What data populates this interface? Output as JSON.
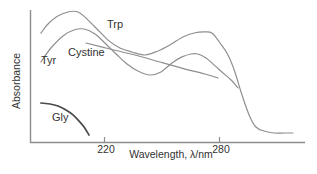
{
  "figure": {
    "background": "#ffffff",
    "text_color": "#333333",
    "axis_color": "#8d8d8d"
  },
  "chart_data": {
    "type": "line",
    "title": "",
    "xlabel": "Wavelength, λ/nm",
    "ylabel": "Absorbance",
    "x_unit": "nm",
    "y_unit": "relative absorbance (unlabeled axis)",
    "x_range_nm": [
      181,
      320
    ],
    "y_range_rel": [
      0,
      1.05
    ],
    "grid": false,
    "legend": "inline-labels",
    "x_ticks": [
      {
        "label": "220",
        "nm": 220
      },
      {
        "label": "280",
        "nm": 280
      }
    ],
    "series": [
      {
        "name": "Trp",
        "color": "#8f8f8f",
        "width": 1.2,
        "label_anchor_px": {
          "x": 107,
          "y": 28
        },
        "points": [
          [
            187.1,
            0.827
          ],
          [
            191.8,
            0.91
          ],
          [
            198.1,
            0.97
          ],
          [
            206.4,
            0.985
          ],
          [
            215.3,
            0.872
          ],
          [
            222.1,
            0.774
          ],
          [
            228.3,
            0.714
          ],
          [
            234.6,
            0.684
          ],
          [
            241.4,
            0.662
          ],
          [
            248.2,
            0.692
          ],
          [
            254.4,
            0.737
          ],
          [
            261.2,
            0.797
          ],
          [
            267.0,
            0.827
          ],
          [
            272.2,
            0.835
          ],
          [
            276.3,
            0.827
          ],
          [
            280.5,
            0.752
          ],
          [
            284.7,
            0.662
          ],
          [
            288.3,
            0.534
          ],
          [
            292.0,
            0.361
          ],
          [
            295.7,
            0.211
          ],
          [
            299.3,
            0.12
          ],
          [
            303.5,
            0.09
          ],
          [
            308.7,
            0.075
          ],
          [
            314.4,
            0.075
          ],
          [
            318.6,
            0.075
          ]
        ]
      },
      {
        "name": "Tyr",
        "color": "#8f8f8f",
        "width": 1.2,
        "label_anchor_px": {
          "x": 41,
          "y": 64
        },
        "points": [
          [
            187.1,
            0.609
          ],
          [
            192.3,
            0.714
          ],
          [
            198.6,
            0.805
          ],
          [
            204.3,
            0.85
          ],
          [
            209.6,
            0.857
          ],
          [
            215.3,
            0.82
          ],
          [
            221.0,
            0.744
          ],
          [
            226.3,
            0.669
          ],
          [
            232.0,
            0.594
          ],
          [
            237.7,
            0.541
          ],
          [
            244.0,
            0.511
          ],
          [
            249.7,
            0.534
          ],
          [
            255.5,
            0.602
          ],
          [
            260.7,
            0.647
          ],
          [
            265.4,
            0.669
          ],
          [
            269.0,
            0.669
          ],
          [
            273.2,
            0.639
          ],
          [
            277.4,
            0.587
          ],
          [
            282.1,
            0.526
          ],
          [
            286.3,
            0.474
          ],
          [
            289.9,
            0.414
          ]
        ]
      },
      {
        "name": "Cystine",
        "color": "#8f8f8f",
        "width": 1.2,
        "label_anchor_px": {
          "x": 68,
          "y": 56
        },
        "points": [
          [
            210.6,
            0.752
          ],
          [
            223.1,
            0.707
          ],
          [
            236.2,
            0.662
          ],
          [
            249.2,
            0.609
          ],
          [
            262.3,
            0.556
          ],
          [
            272.7,
            0.519
          ],
          [
            279.5,
            0.489
          ]
        ]
      },
      {
        "name": "Gly",
        "color": "#4a4a4a",
        "width": 1.7,
        "label_anchor_px": {
          "x": 52,
          "y": 121
        },
        "points": [
          [
            187.1,
            0.301
          ],
          [
            191.8,
            0.293
          ],
          [
            196.0,
            0.278
          ],
          [
            200.2,
            0.248
          ],
          [
            203.8,
            0.211
          ],
          [
            207.0,
            0.165
          ],
          [
            209.6,
            0.12
          ],
          [
            212.2,
            0.06
          ]
        ]
      }
    ]
  }
}
